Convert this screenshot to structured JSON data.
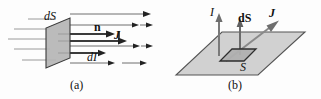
{
  "figure": {
    "width": 321,
    "height": 99,
    "background_color": "#fdfdfd",
    "ink_color": "#111111",
    "fill_gray": "#b8b8b8",
    "line_gray": "#8a8a8a",
    "panels": [
      {
        "id": "a",
        "caption": "(a)",
        "description": "Current-density flux through an oriented surface element dS",
        "labels": [
          {
            "name": "label-dS-a",
            "text": "dS",
            "style": "italic",
            "meaning": "surface-element"
          },
          {
            "name": "label-n-a",
            "text": "n",
            "style": "bold",
            "meaning": "unit-normal-vector"
          },
          {
            "name": "label-J-a",
            "text": "J",
            "style": "bold-italic",
            "meaning": "current-density-vector"
          },
          {
            "name": "label-dJ-a",
            "text": "dI",
            "style": "italic",
            "meaning": "current-element"
          }
        ],
        "flow_lines": 5,
        "arrow_direction": "right"
      },
      {
        "id": "b",
        "caption": "(b)",
        "description": "Total current I through surface S with element dS and current density J",
        "labels": [
          {
            "name": "label-I-b",
            "text": "I",
            "style": "italic",
            "meaning": "total-current"
          },
          {
            "name": "label-dS-b",
            "text": "dS",
            "style": "bold-mixed",
            "meaning": "vector-surface-element"
          },
          {
            "name": "label-J-b",
            "text": "J",
            "style": "bold-italic",
            "meaning": "current-density-vector"
          },
          {
            "name": "label-S-b",
            "text": "S",
            "style": "italic",
            "meaning": "surface"
          }
        ],
        "arrows": [
          {
            "name": "current-arrow",
            "direction": "up"
          },
          {
            "name": "dS-normal-arrow",
            "direction": "up"
          },
          {
            "name": "J-arrow",
            "direction": "up-right-diagonal"
          }
        ]
      }
    ]
  }
}
